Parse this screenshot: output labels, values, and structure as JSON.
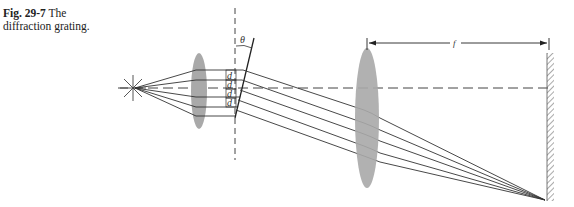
{
  "caption": {
    "figure_number": "Fig. 29-7",
    "title": "The diffraction grating."
  },
  "diagram": {
    "labels": {
      "angle": "θ",
      "slit_spacing": [
        "d",
        "d",
        "d",
        "d"
      ],
      "focal_length": "f"
    },
    "components": [
      "point-source",
      "collimating-lens",
      "diffraction-grating",
      "focusing-lens",
      "screen"
    ],
    "colors": {
      "lens_fill": "#a9a9a9",
      "line": "#333333",
      "background": "#ffffff"
    }
  }
}
